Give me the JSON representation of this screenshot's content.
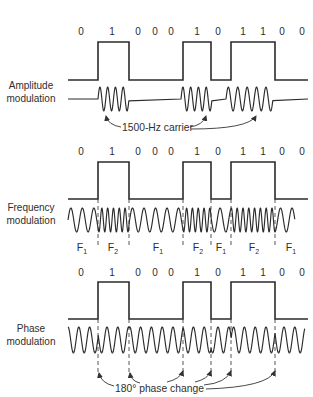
{
  "figure": {
    "sections": [
      {
        "id": "amplitude",
        "label_line1": "Amplitude",
        "label_line2": "modulation",
        "bits": [
          "0",
          "1",
          "0",
          "0",
          "0",
          "1",
          "0",
          "1",
          "1",
          "0",
          "0"
        ]
      },
      {
        "id": "frequency",
        "label_line1": "Frequency",
        "label_line2": "modulation",
        "bits": [
          "0",
          "1",
          "0",
          "0",
          "0",
          "1",
          "0",
          "1",
          "1",
          "0",
          "0"
        ],
        "freq_labels": [
          {
            "main": "F",
            "sub": "1"
          },
          {
            "main": "F",
            "sub": "2"
          },
          {
            "main": "F",
            "sub": "1"
          },
          {
            "main": "F",
            "sub": "2"
          },
          {
            "main": "F",
            "sub": "1"
          },
          {
            "main": "F",
            "sub": "2"
          },
          {
            "main": "F",
            "sub": "1"
          }
        ]
      },
      {
        "id": "phase",
        "label_line1": "Phase",
        "label_line2": "modulation",
        "bits": [
          "0",
          "1",
          "0",
          "0",
          "0",
          "1",
          "0",
          "1",
          "1",
          "0",
          "0"
        ]
      }
    ],
    "annotations": {
      "carrier": "1500-Hz carrier",
      "phase_change": "180° phase change"
    },
    "signal": {
      "edges_x": [
        68,
        98,
        129,
        183,
        211,
        231,
        275,
        308
      ],
      "levels": [
        "0",
        "1",
        "0",
        "1",
        "0",
        "1",
        "0"
      ]
    },
    "waveforms": {
      "am": {
        "x0": 68,
        "x1": 308,
        "y0": 99,
        "amp": 12,
        "bursts": [
          {
            "x0": 98,
            "x1": 129,
            "cycles": 4
          },
          {
            "x0": 181,
            "x1": 212,
            "cycles": 4
          },
          {
            "x0": 226,
            "x1": 273,
            "cycles": 5
          }
        ]
      },
      "fm": {
        "x0": 68,
        "x1": 295,
        "y0": 220,
        "amp": 12,
        "f1_period": 11.5,
        "f2_period": 5.8,
        "segments": [
          [
            68,
            98,
            "F1"
          ],
          [
            98,
            129,
            "F2"
          ],
          [
            129,
            183,
            "F1"
          ],
          [
            183,
            211,
            "F2"
          ],
          [
            211,
            231,
            "F1"
          ],
          [
            231,
            275,
            "F2"
          ],
          [
            275,
            295,
            "F1"
          ]
        ]
      },
      "pm": {
        "x0": 68,
        "x1": 305,
        "y0": 340,
        "amp": 13,
        "period": 10.8,
        "flips_x": [
          98,
          129,
          183,
          211,
          231,
          275
        ]
      }
    },
    "colors": {
      "ink": "#2b2b2b",
      "background": "#ffffff"
    }
  }
}
